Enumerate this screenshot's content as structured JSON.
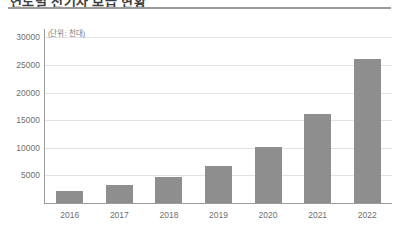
{
  "header": {
    "title": "연도별 전기차 보급 현황",
    "divider_color": "#9a9a9a"
  },
  "colors": {
    "bar": "#8e8e8e",
    "gridline": "#e2e2e2",
    "axis": "#9d9d9d",
    "tick_text": "#6f6f6f",
    "background": "#ffffff"
  },
  "chart_data": {
    "type": "bar",
    "title": "연도별 전기차 보급 현황",
    "unit_label": "(단위: 천대)",
    "xlabel": "",
    "ylabel": "",
    "categories": [
      "2016",
      "2017",
      "2018",
      "2019",
      "2020",
      "2021",
      "2022"
    ],
    "values": [
      2200,
      3300,
      4700,
      6700,
      10100,
      16100,
      26000
    ],
    "ylim": [
      0,
      31500
    ],
    "yticks": [
      5000,
      10000,
      15000,
      20000,
      25000,
      30000
    ],
    "ytick_labels": [
      "5000",
      "10000",
      "15000",
      "20000",
      "25000",
      "30000"
    ],
    "grid": true,
    "grid_axis": "y",
    "legend": false,
    "legend_position": "none",
    "series": [
      {
        "name": "보급대수",
        "values": [
          2200,
          3300,
          4700,
          6700,
          10100,
          16100,
          26000
        ],
        "color": "#8e8e8e"
      }
    ]
  }
}
